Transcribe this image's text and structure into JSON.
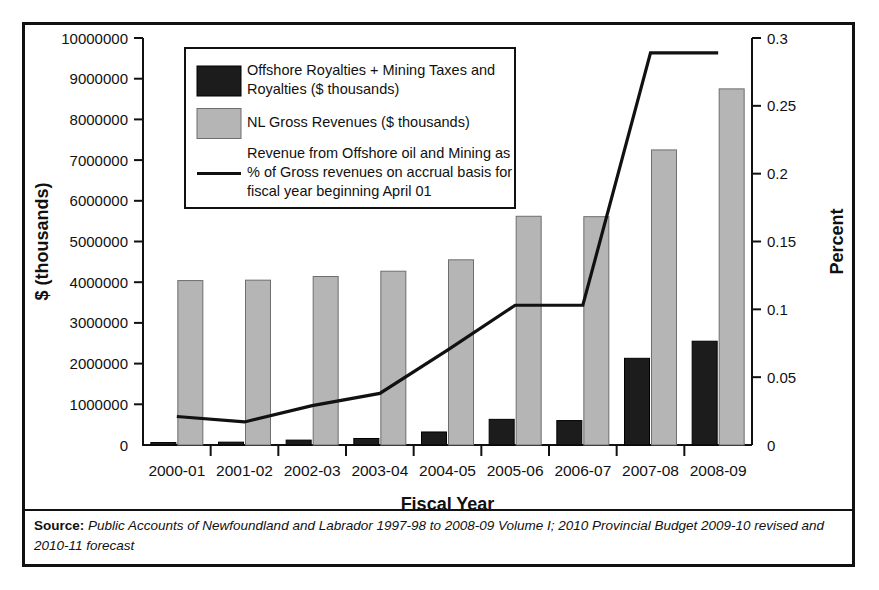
{
  "chart_data": {
    "type": "bar",
    "title": "",
    "categories": [
      "2000-01",
      "2001-02",
      "2002-03",
      "2003-04",
      "2004-05",
      "2005-06",
      "2006-07",
      "2007-08",
      "2008-09"
    ],
    "xlabel": "Fiscal Year",
    "ylabel": "$ (thousands)",
    "y2label": "Percent",
    "ylim": [
      0,
      10000000
    ],
    "y2lim": [
      0,
      0.3
    ],
    "yticks": [
      0,
      1000000,
      2000000,
      3000000,
      4000000,
      5000000,
      6000000,
      7000000,
      8000000,
      9000000,
      10000000
    ],
    "ytick_labels": [
      "0",
      "1000000",
      "2000000",
      "3000000",
      "4000000",
      "5000000",
      "6000000",
      "7000000",
      "8000000",
      "9000000",
      "10000000"
    ],
    "y2ticks": [
      0,
      0.05,
      0.1,
      0.15,
      0.2,
      0.25,
      0.3
    ],
    "y2tick_labels": [
      "0",
      "0.05",
      "0.1",
      "0.15",
      "0.2",
      "0.25",
      "0.3"
    ],
    "grid": false,
    "legend_position": "upper-left-inside",
    "series": [
      {
        "name": "Offshore Royalties + Mining Taxes and Royalties ($ thousands)",
        "type": "bar",
        "axis": "left",
        "color": "#1c1c1c",
        "values": [
          60000,
          70000,
          120000,
          160000,
          320000,
          630000,
          600000,
          2130000,
          2550000
        ]
      },
      {
        "name": "NL Gross Revenues ($ thousands)",
        "type": "bar",
        "axis": "left",
        "color": "#b5b5b5",
        "values": [
          4040000,
          4050000,
          4140000,
          4270000,
          4550000,
          5620000,
          5610000,
          7250000,
          8750000
        ]
      },
      {
        "name": "Revenue from Offshore oil and Mining as % of Gross revenues on accrual basis for fiscal year beginning April 01",
        "type": "line",
        "axis": "right",
        "color": "#111111",
        "values": [
          0.021,
          0.017,
          0.029,
          0.038,
          0.07,
          0.103,
          0.103,
          0.289,
          0.289
        ]
      }
    ]
  },
  "legend": {
    "entries": [
      {
        "marker": "dark-swatch",
        "lines": [
          "Offshore Royalties + Mining Taxes and",
          "Royalties ($ thousands)"
        ]
      },
      {
        "marker": "light-swatch",
        "lines": [
          "NL Gross Revenues ($ thousands)"
        ]
      },
      {
        "marker": "line-sample",
        "lines": [
          "Revenue from Offshore oil and Mining as",
          "% of Gross revenues on accrual basis for",
          "fiscal year beginning April 01"
        ]
      }
    ]
  },
  "source": {
    "label": "Source:",
    "text": " Public Accounts of Newfoundland and Labrador 1997-98 to 2008-09 Volume I; 2010 Provincial Budget 2009-10 revised and 2010-11 forecast"
  },
  "colors": {
    "bar_dark": "#1c1c1c",
    "bar_light": "#b5b5b5",
    "line": "#111111",
    "frame": "#111111",
    "background": "#ffffff"
  }
}
